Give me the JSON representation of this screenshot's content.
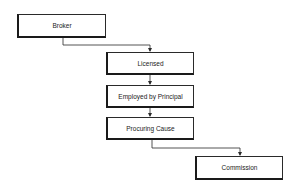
{
  "diagram": {
    "type": "flowchart",
    "nodes": [
      {
        "id": "broker",
        "label": "Broker",
        "x": 17,
        "y": 14,
        "w": 89,
        "h": 24
      },
      {
        "id": "licensed",
        "label": "Licensed",
        "x": 106,
        "y": 52,
        "w": 88,
        "h": 23
      },
      {
        "id": "employed",
        "label": "Employed by Principal",
        "x": 106,
        "y": 85,
        "w": 88,
        "h": 23
      },
      {
        "id": "procuring",
        "label": "Procuring Cause",
        "x": 106,
        "y": 117,
        "w": 88,
        "h": 23
      },
      {
        "id": "commission",
        "label": "Commission",
        "x": 195,
        "y": 156,
        "w": 88,
        "h": 24
      }
    ],
    "edges": [
      {
        "from": "broker",
        "to": "licensed"
      },
      {
        "from": "licensed",
        "to": "employed"
      },
      {
        "from": "employed",
        "to": "procuring"
      },
      {
        "from": "procuring",
        "to": "commission"
      }
    ],
    "line_color": "#2a2a2a"
  }
}
